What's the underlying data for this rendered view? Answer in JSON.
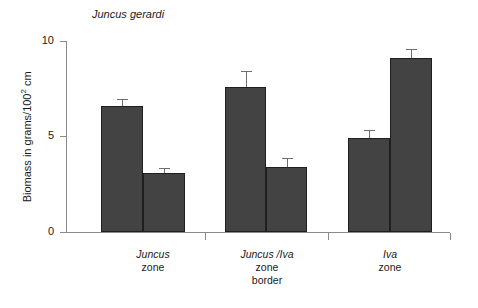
{
  "chart_data": {
    "type": "bar",
    "title": "Juncus gerardi",
    "xlabel": "",
    "ylabel": "Biomass in grams/100² cm",
    "ylim": [
      0,
      10
    ],
    "yticks": [
      0,
      5,
      10
    ],
    "ytick_labels": [
      "0",
      "5",
      "10"
    ],
    "grid": false,
    "legend": "none",
    "categories": [
      "Juncus zone",
      "Juncus /Iva zone border",
      "Iva zone"
    ],
    "series": [
      {
        "name": "bar 1 of pair",
        "values": [
          6.6,
          7.6,
          4.9
        ]
      },
      {
        "name": "bar 2 of pair",
        "values": [
          3.1,
          3.4,
          9.1
        ]
      }
    ],
    "errors": [
      {
        "name": "bar 1 of pair",
        "values": [
          0.35,
          0.85,
          0.45
        ]
      },
      {
        "name": "bar 2 of pair",
        "values": [
          0.25,
          0.45,
          0.5
        ]
      }
    ],
    "bars": [
      {
        "label": "Juncus zone - left",
        "value": 6.6,
        "error": 0.35
      },
      {
        "label": "Juncus zone - right",
        "value": 3.1,
        "error": 0.25
      },
      {
        "label": "Juncus /Iva zone border - left",
        "value": 7.6,
        "error": 0.85
      },
      {
        "label": "Juncus /Iva zone border - right",
        "value": 3.4,
        "error": 0.45
      },
      {
        "label": "Iva zone - left",
        "value": 4.9,
        "error": 0.45
      },
      {
        "label": "Iva zone - right",
        "value": 9.1,
        "error": 0.5
      }
    ],
    "bar_color": "#434343",
    "axis_color": "#8a8a8a",
    "error_bar_color": "#6f6f6f"
  },
  "axis": {
    "y_title_main": "Biomass in grams/100",
    "y_title_sup": "2",
    "y_title_tail": " cm",
    "tick_10": "10",
    "tick_5": "5",
    "tick_0": "0"
  },
  "groups": [
    {
      "species": "Juncus",
      "line2": "zone",
      "line3": ""
    },
    {
      "species": "Juncus /Iva",
      "line2": "zone",
      "line3": "border"
    },
    {
      "species": "Iva",
      "line2": "zone",
      "line3": ""
    }
  ]
}
